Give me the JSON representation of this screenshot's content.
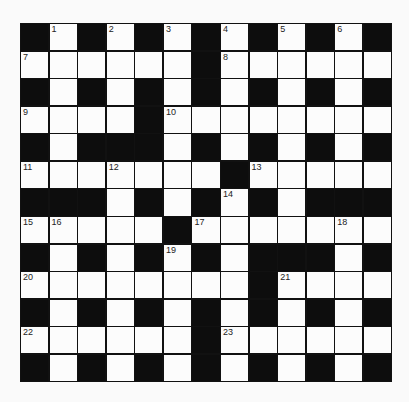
{
  "puzzle": {
    "rows": 13,
    "cols": 13,
    "layout": [
      "#.#.#.#.#.#.#",
      "......#......",
      "#.#.#.#.#.#.#",
      "....#........",
      "#.###.#.#.#.#",
      ".......#.....",
      "###.#.#.#.###",
      ".....#.......",
      "#.#.#.#.###.#",
      "........#....",
      "#.#.#.#.#.#.#",
      "......#......",
      "#.#.#.#.#.#.#"
    ],
    "numbers": [
      {
        "row": 0,
        "col": 1,
        "n": "1"
      },
      {
        "row": 0,
        "col": 3,
        "n": "2"
      },
      {
        "row": 0,
        "col": 5,
        "n": "3"
      },
      {
        "row": 0,
        "col": 7,
        "n": "4"
      },
      {
        "row": 0,
        "col": 9,
        "n": "5"
      },
      {
        "row": 0,
        "col": 11,
        "n": "6"
      },
      {
        "row": 1,
        "col": 0,
        "n": "7"
      },
      {
        "row": 1,
        "col": 7,
        "n": "8"
      },
      {
        "row": 3,
        "col": 0,
        "n": "9"
      },
      {
        "row": 3,
        "col": 5,
        "n": "10"
      },
      {
        "row": 5,
        "col": 0,
        "n": "11"
      },
      {
        "row": 5,
        "col": 3,
        "n": "12"
      },
      {
        "row": 5,
        "col": 8,
        "n": "13"
      },
      {
        "row": 6,
        "col": 7,
        "n": "14"
      },
      {
        "row": 7,
        "col": 0,
        "n": "15"
      },
      {
        "row": 7,
        "col": 1,
        "n": "16"
      },
      {
        "row": 7,
        "col": 6,
        "n": "17"
      },
      {
        "row": 7,
        "col": 11,
        "n": "18"
      },
      {
        "row": 8,
        "col": 5,
        "n": "19"
      },
      {
        "row": 9,
        "col": 0,
        "n": "20"
      },
      {
        "row": 9,
        "col": 9,
        "n": "21"
      },
      {
        "row": 11,
        "col": 0,
        "n": "22"
      },
      {
        "row": 11,
        "col": 7,
        "n": "23"
      }
    ],
    "colors": {
      "black_cell": "#0d0d0d",
      "white_cell": "#fcfcfc",
      "background": "#fafafa"
    }
  }
}
